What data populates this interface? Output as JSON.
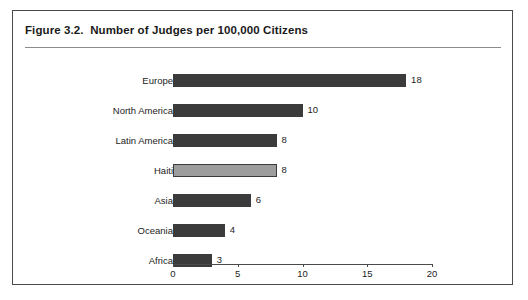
{
  "figure": {
    "title": "Figure 3.2.  Number of Judges per 100,000 Citizens"
  },
  "chart_data": {
    "type": "bar",
    "orientation": "horizontal",
    "title": "Figure 3.2.  Number of Judges per 100,000 Citizens",
    "xlabel": "",
    "ylabel": "",
    "xlim": [
      0,
      20
    ],
    "xticks": [
      0,
      5,
      10,
      15,
      20
    ],
    "xtick_labels": [
      "0",
      "5",
      "10",
      "15",
      "20"
    ],
    "grid": false,
    "legend": null,
    "categories": [
      "Europe",
      "North America",
      "Latin America",
      "Haiti",
      "Asia",
      "Oceania",
      "Africa"
    ],
    "values": [
      18,
      10,
      8,
      8,
      6,
      4,
      3
    ],
    "value_labels": [
      "18",
      "10",
      "8",
      "8",
      "6",
      "4",
      "3"
    ],
    "bar_colors": [
      "#3b3b3b",
      "#3b3b3b",
      "#3b3b3b",
      "#9d9d9d",
      "#3b3b3b",
      "#3b3b3b",
      "#3b3b3b"
    ],
    "highlighted_category": "Haiti",
    "bars": [
      {
        "label": "Europe",
        "value": 18,
        "value_label": "18",
        "style": "dark"
      },
      {
        "label": "North America",
        "value": 10,
        "value_label": "10",
        "style": "dark"
      },
      {
        "label": "Latin America",
        "value": 8,
        "value_label": "8",
        "style": "dark"
      },
      {
        "label": "Haiti",
        "value": 8,
        "value_label": "8",
        "style": "light"
      },
      {
        "label": "Asia",
        "value": 6,
        "value_label": "6",
        "style": "dark"
      },
      {
        "label": "Oceania",
        "value": 4,
        "value_label": "4",
        "style": "dark"
      },
      {
        "label": "Africa",
        "value": 3,
        "value_label": "3",
        "style": "dark"
      }
    ]
  },
  "colors": {
    "bar_dark": "#3b3b3b",
    "bar_light": "#9d9d9d",
    "frame": "#4a4a4a",
    "rule": "#8c8c8c",
    "text": "#1c1c1c",
    "background": "#ffffff"
  }
}
